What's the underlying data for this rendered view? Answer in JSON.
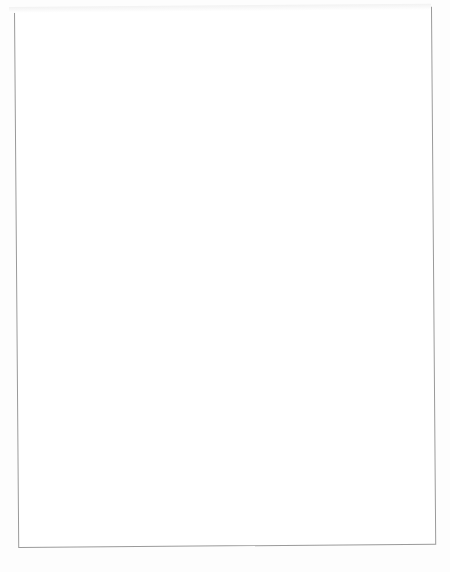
{
  "figure": {
    "orientation": "rotated-90-ccw",
    "rows": [
      {
        "criterion": "Determinant criterion",
        "panels": [
          {
            "title": "One-parameter model",
            "xlabel": "SD ability",
            "xticks": [
              "0.0",
              "0.5",
              "1.0",
              "1.5",
              "2.0"
            ],
            "yticks": [
              "0.0",
              "0.5",
              "1.0",
              "1.5",
              "2.0"
            ],
            "curve_labels": [
              {
                "text": "a = 2.0",
                "x": 0.36,
                "y": 0.49
              }
            ]
          },
          {
            "title": "Two-parameter model",
            "xlabel": "SD ability",
            "xticks": [
              "0.0",
              "0.5",
              "1.0",
              "1.5",
              "2.0"
            ],
            "yticks": [
              "0.0",
              "0.5",
              "1.0",
              "1.5",
              "2.0"
            ],
            "curve_labels": [
              {
                "text": "a = 0.5",
                "x": 0.2,
                "y": 0.9
              },
              {
                "text": "a = 2.0",
                "x": 0.52,
                "y": 0.66
              }
            ]
          },
          {
            "title": "Three-parameter model",
            "xlabel": "SD ability",
            "xticks": [
              "0.0",
              "0.5",
              "1.0",
              "1.5",
              "2.0"
            ],
            "yticks": [
              "0.0",
              "0.5",
              "1.0",
              "1.5",
              "2.0"
            ],
            "curve_labels": [
              {
                "text": "a = 0.5",
                "x": 0.18,
                "y": 0.92
              },
              {
                "text": "a = 2.0",
                "x": 0.56,
                "y": 0.63
              }
            ]
          }
        ]
      },
      {
        "criterion": "Trace criterion",
        "panels": [
          {
            "title": "One-parameter model",
            "xlabel": "SD ability",
            "xticks": [
              "0.0",
              "0.5",
              "1.0",
              "1.5",
              "2.0"
            ],
            "yticks": [
              "0.0",
              "0.5",
              "1.0",
              "1.5",
              "2.0"
            ],
            "curve_labels": [
              {
                "text": "a = 0.5",
                "x": 0.2,
                "y": 0.86
              },
              {
                "text": "a = 2.0",
                "x": 0.4,
                "y": 0.5
              }
            ]
          },
          {
            "title": "Two-parameter model",
            "xlabel": "SD ability",
            "xticks": [
              "0.0",
              "0.5",
              "1.0",
              "1.5",
              "2.0"
            ],
            "yticks": [
              "0.0",
              "0.5",
              "1.0",
              "1.5",
              "2.0"
            ],
            "curve_labels": [
              {
                "text": "a = 2.0",
                "x": 0.5,
                "y": 0.62
              }
            ]
          },
          {
            "title": "Three-parameter model",
            "xlabel": "SD ability",
            "xticks": [
              "0.0",
              "0.5",
              "1.0",
              "1.5",
              "2.0"
            ],
            "yticks": [
              "0.0",
              "0.5",
              "1.0",
              "1.5",
              "2.0"
            ],
            "curve_labels": [
              {
                "text": "a = 2.0",
                "x": 0.52,
                "y": 0.62
              }
            ]
          }
        ]
      }
    ]
  },
  "chart_data": [
    {
      "type": "line",
      "title": "Determinant criterion — One-parameter model",
      "xlabel": "SD ability",
      "ylabel": "",
      "xlim": [
        0.0,
        2.0
      ],
      "ylim": [
        0.0,
        2.0
      ],
      "xticks": [
        0.0,
        0.5,
        1.0,
        1.5,
        2.0
      ],
      "yticks": [
        0.0,
        0.5,
        1.0,
        1.5,
        2.0
      ],
      "grid": false,
      "legend": "inline-annotations",
      "annotations": [
        "a = 2.0"
      ],
      "x": [
        0.0,
        0.1,
        0.2,
        0.3,
        0.4,
        0.5,
        0.75,
        1.0,
        1.25,
        1.5,
        1.75,
        2.0
      ],
      "series": [
        {
          "name": "a = 0.5",
          "values": [
            0.73,
            0.83,
            0.88,
            0.9,
            0.92,
            0.93,
            0.95,
            0.96,
            0.96,
            0.97,
            0.97,
            0.98
          ]
        },
        {
          "name": "a = 1.0",
          "values": [
            0.67,
            0.79,
            0.85,
            0.87,
            0.89,
            0.9,
            0.92,
            0.93,
            0.94,
            0.94,
            0.95,
            0.95
          ]
        },
        {
          "name": "a = 1.5",
          "values": [
            0.61,
            0.75,
            0.81,
            0.84,
            0.86,
            0.87,
            0.89,
            0.9,
            0.91,
            0.92,
            0.92,
            0.93
          ]
        },
        {
          "name": "a = 2.0",
          "values": [
            0.54,
            0.7,
            0.77,
            0.81,
            0.83,
            0.84,
            0.86,
            0.88,
            0.89,
            0.89,
            0.9,
            0.9
          ]
        }
      ]
    },
    {
      "type": "line",
      "title": "Determinant criterion — Two-parameter model",
      "xlabel": "SD ability",
      "ylabel": "",
      "xlim": [
        0.0,
        2.0
      ],
      "ylim": [
        0.0,
        2.0
      ],
      "xticks": [
        0.0,
        0.5,
        1.0,
        1.5,
        2.0
      ],
      "yticks": [
        0.0,
        0.5,
        1.0,
        1.5,
        2.0
      ],
      "grid": false,
      "legend": "inline-annotations",
      "annotations": [
        "a = 0.5",
        "a = 2.0"
      ],
      "x": [
        0.0,
        0.1,
        0.2,
        0.3,
        0.4,
        0.5,
        0.75,
        1.0,
        1.25,
        1.5,
        1.75,
        2.0
      ],
      "series": [
        {
          "name": "a = 0.5",
          "values": [
            0.8,
            0.88,
            0.92,
            0.94,
            0.95,
            0.96,
            0.97,
            0.98,
            0.98,
            0.99,
            0.99,
            0.99
          ]
        },
        {
          "name": "a = 1.0",
          "values": [
            0.66,
            0.8,
            0.86,
            0.89,
            0.9,
            0.91,
            0.93,
            0.94,
            0.95,
            0.95,
            0.96,
            0.96
          ]
        },
        {
          "name": "a = 1.5",
          "values": [
            0.52,
            0.7,
            0.79,
            0.83,
            0.85,
            0.87,
            0.89,
            0.91,
            0.92,
            0.92,
            0.93,
            0.93
          ]
        },
        {
          "name": "a = 2.0",
          "values": [
            0.38,
            0.6,
            0.71,
            0.77,
            0.8,
            0.82,
            0.85,
            0.87,
            0.88,
            0.89,
            0.9,
            0.9
          ]
        }
      ]
    },
    {
      "type": "line",
      "title": "Determinant criterion — Three-parameter model",
      "xlabel": "SD ability",
      "ylabel": "",
      "xlim": [
        0.0,
        2.0
      ],
      "ylim": [
        0.0,
        2.0
      ],
      "xticks": [
        0.0,
        0.5,
        1.0,
        1.5,
        2.0
      ],
      "yticks": [
        0.0,
        0.5,
        1.0,
        1.5,
        2.0
      ],
      "grid": false,
      "legend": "inline-annotations",
      "annotations": [
        "a = 0.5",
        "a = 2.0"
      ],
      "x": [
        0.0,
        0.1,
        0.2,
        0.3,
        0.4,
        0.5,
        0.75,
        1.0,
        1.25,
        1.5,
        1.75,
        2.0
      ],
      "series": [
        {
          "name": "a = 0.5",
          "values": [
            0.82,
            0.9,
            0.93,
            0.95,
            0.96,
            0.97,
            0.98,
            0.99,
            0.99,
            0.99,
            1.0,
            1.0
          ]
        },
        {
          "name": "a = 1.0",
          "values": [
            0.62,
            0.78,
            0.85,
            0.88,
            0.9,
            0.91,
            0.93,
            0.94,
            0.95,
            0.96,
            0.96,
            0.96
          ]
        },
        {
          "name": "a = 1.5",
          "values": [
            0.46,
            0.66,
            0.76,
            0.81,
            0.84,
            0.86,
            0.89,
            0.9,
            0.91,
            0.92,
            0.93,
            0.93
          ]
        },
        {
          "name": "a = 2.0",
          "values": [
            0.3,
            0.54,
            0.67,
            0.74,
            0.78,
            0.8,
            0.84,
            0.86,
            0.88,
            0.89,
            0.89,
            0.9
          ]
        }
      ]
    },
    {
      "type": "line",
      "title": "Trace criterion — One-parameter model",
      "xlabel": "SD ability",
      "ylabel": "",
      "xlim": [
        0.0,
        2.0
      ],
      "ylim": [
        0.0,
        2.0
      ],
      "xticks": [
        0.0,
        0.5,
        1.0,
        1.5,
        2.0
      ],
      "yticks": [
        0.0,
        0.5,
        1.0,
        1.5,
        2.0
      ],
      "grid": false,
      "legend": "inline-annotations",
      "annotations": [
        "a = 0.5",
        "a = 2.0"
      ],
      "x": [
        0.0,
        0.1,
        0.2,
        0.3,
        0.4,
        0.5,
        0.75,
        1.0,
        1.25,
        1.5,
        1.75,
        2.0
      ],
      "series": [
        {
          "name": "a = 0.5",
          "values": [
            0.76,
            0.85,
            0.89,
            0.91,
            0.93,
            0.94,
            0.95,
            0.96,
            0.97,
            0.97,
            0.98,
            0.98
          ]
        },
        {
          "name": "a = 1.0",
          "values": [
            0.7,
            0.81,
            0.86,
            0.88,
            0.9,
            0.91,
            0.93,
            0.94,
            0.94,
            0.95,
            0.95,
            0.96
          ]
        },
        {
          "name": "a = 1.5",
          "values": [
            0.63,
            0.77,
            0.83,
            0.85,
            0.87,
            0.88,
            0.9,
            0.91,
            0.92,
            0.92,
            0.93,
            0.93
          ]
        },
        {
          "name": "a = 2.0",
          "values": [
            0.55,
            0.71,
            0.78,
            0.82,
            0.84,
            0.85,
            0.87,
            0.88,
            0.89,
            0.9,
            0.9,
            0.91
          ]
        }
      ]
    },
    {
      "type": "line",
      "title": "Trace criterion — Two-parameter model",
      "xlabel": "SD ability",
      "ylabel": "",
      "xlim": [
        0.0,
        2.0
      ],
      "ylim": [
        0.0,
        2.0
      ],
      "xticks": [
        0.0,
        0.5,
        1.0,
        1.5,
        2.0
      ],
      "yticks": [
        0.0,
        0.5,
        1.0,
        1.5,
        2.0
      ],
      "grid": false,
      "legend": "inline-annotations",
      "annotations": [
        "a = 2.0"
      ],
      "x": [
        0.0,
        0.1,
        0.2,
        0.3,
        0.4,
        0.5,
        0.75,
        1.0,
        1.25,
        1.5,
        1.75,
        2.0
      ],
      "series": [
        {
          "name": "a = 0.5",
          "values": [
            0.72,
            0.86,
            0.91,
            0.93,
            0.94,
            0.95,
            0.96,
            0.97,
            0.97,
            0.98,
            0.98,
            0.98
          ]
        },
        {
          "name": "a = 1.0",
          "values": [
            0.62,
            0.81,
            0.88,
            0.91,
            0.92,
            0.93,
            0.95,
            0.96,
            0.96,
            0.97,
            0.97,
            0.97
          ]
        },
        {
          "name": "a = 1.5",
          "values": [
            0.52,
            0.75,
            0.84,
            0.88,
            0.9,
            0.91,
            0.93,
            0.94,
            0.95,
            0.95,
            0.96,
            0.96
          ]
        },
        {
          "name": "a = 2.0",
          "values": [
            0.41,
            0.68,
            0.79,
            0.84,
            0.87,
            0.89,
            0.91,
            0.92,
            0.93,
            0.94,
            0.94,
            0.95
          ]
        }
      ]
    },
    {
      "type": "line",
      "title": "Trace criterion — Three-parameter model",
      "xlabel": "SD ability",
      "ylabel": "",
      "xlim": [
        0.0,
        2.0
      ],
      "ylim": [
        0.0,
        2.0
      ],
      "xticks": [
        0.0,
        0.5,
        1.0,
        1.5,
        2.0
      ],
      "yticks": [
        0.0,
        0.5,
        1.0,
        1.5,
        2.0
      ],
      "grid": false,
      "legend": "inline-annotations",
      "annotations": [
        "a = 2.0"
      ],
      "x": [
        0.0,
        0.1,
        0.2,
        0.3,
        0.4,
        0.5,
        0.75,
        1.0,
        1.25,
        1.5,
        1.75,
        2.0
      ],
      "series": [
        {
          "name": "a = 0.5",
          "values": [
            0.7,
            0.86,
            0.91,
            0.93,
            0.95,
            0.95,
            0.97,
            0.97,
            0.98,
            0.98,
            0.98,
            0.99
          ]
        },
        {
          "name": "a = 1.0",
          "values": [
            0.58,
            0.8,
            0.88,
            0.91,
            0.92,
            0.94,
            0.95,
            0.96,
            0.97,
            0.97,
            0.97,
            0.98
          ]
        },
        {
          "name": "a = 1.5",
          "values": [
            0.46,
            0.73,
            0.83,
            0.88,
            0.9,
            0.91,
            0.93,
            0.95,
            0.95,
            0.96,
            0.96,
            0.97
          ]
        },
        {
          "name": "a = 2.0",
          "values": [
            0.34,
            0.64,
            0.77,
            0.83,
            0.86,
            0.88,
            0.91,
            0.93,
            0.94,
            0.94,
            0.95,
            0.95
          ]
        }
      ]
    }
  ]
}
